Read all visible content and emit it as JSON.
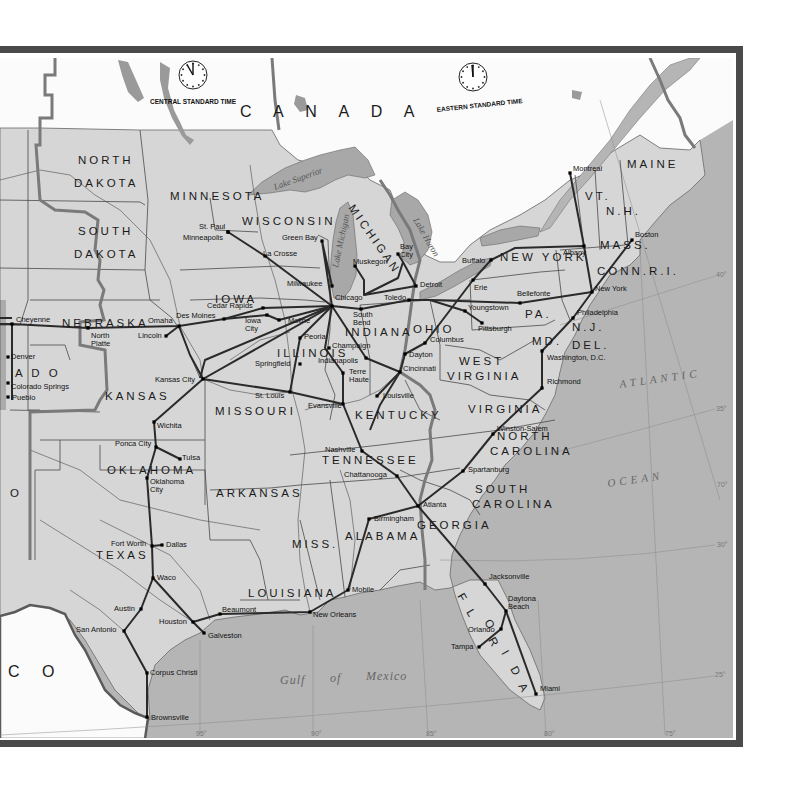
{
  "map": {
    "country_labels": [
      {
        "id": "canada",
        "text": "C A N A D A",
        "x": 240,
        "y": 117,
        "rot": 0
      },
      {
        "id": "mexico",
        "text": "C O",
        "x": 8,
        "y": 677,
        "rot": 0
      }
    ],
    "water_labels": [
      {
        "id": "atlantic",
        "text": "ATLANTIC",
        "x": 620,
        "y": 388,
        "rot": -8
      },
      {
        "id": "ocean",
        "text": "OCEAN",
        "x": 608,
        "y": 487,
        "rot": -8
      },
      {
        "id": "gulf",
        "text": "Gulf",
        "x": 280,
        "y": 684,
        "rot": 0
      },
      {
        "id": "of",
        "text": "of",
        "x": 330,
        "y": 682,
        "rot": 0
      },
      {
        "id": "mexico-gulf",
        "text": "Mexico",
        "x": 366,
        "y": 680,
        "rot": 0
      }
    ],
    "lake_labels": [
      {
        "id": "superior",
        "text": "Lake Superior",
        "x": 275,
        "y": 190,
        "rot": -20
      },
      {
        "id": "michigan",
        "text": "Lake Michigan",
        "x": 338,
        "y": 268,
        "rot": -78
      },
      {
        "id": "huron",
        "text": "Lake Huron",
        "x": 413,
        "y": 220,
        "rot": 60
      }
    ],
    "time_zones": [
      {
        "id": "central",
        "text": "CENTRAL STANDARD TIME",
        "x": 150,
        "y": 104,
        "clock_x": 193,
        "clock_y": 75,
        "hand_angle": -30
      },
      {
        "id": "eastern",
        "text": "EASTERN STANDARD TIME",
        "x": 437,
        "y": 112,
        "clock_x": 473,
        "clock_y": 77,
        "hand_angle": -5
      }
    ],
    "states": [
      {
        "text": "NORTH",
        "x": 78,
        "y": 164
      },
      {
        "text": "DAKOTA",
        "x": 74,
        "y": 187
      },
      {
        "text": "SOUTH",
        "x": 78,
        "y": 235
      },
      {
        "text": "DAKOTA",
        "x": 74,
        "y": 258
      },
      {
        "text": "MINNESOTA",
        "x": 170,
        "y": 200
      },
      {
        "text": "WISCONSIN",
        "x": 242,
        "y": 225
      },
      {
        "text": "IOWA",
        "x": 215,
        "y": 303
      },
      {
        "text": "NEBRASKA",
        "x": 62,
        "y": 327
      },
      {
        "text": "A D O",
        "x": 15,
        "y": 377
      },
      {
        "text": "KANSAS",
        "x": 105,
        "y": 400
      },
      {
        "text": "MISSOURI",
        "x": 215,
        "y": 415
      },
      {
        "text": "ILLINOIS",
        "x": 277,
        "y": 357
      },
      {
        "text": "INDIANA",
        "x": 345,
        "y": 336
      },
      {
        "text": "OHIO",
        "x": 413,
        "y": 333
      },
      {
        "text": "KENTUCKY",
        "x": 355,
        "y": 419
      },
      {
        "text": "TENNESSEE",
        "x": 322,
        "y": 464
      },
      {
        "text": "OKLAHOMA",
        "x": 107,
        "y": 474
      },
      {
        "text": "ARKANSAS",
        "x": 216,
        "y": 497
      },
      {
        "text": "TEXAS",
        "x": 96,
        "y": 559
      },
      {
        "text": "MISS.",
        "x": 292,
        "y": 548
      },
      {
        "text": "ALABAMA",
        "x": 345,
        "y": 540
      },
      {
        "text": "LOUISIANA",
        "x": 248,
        "y": 597
      },
      {
        "text": "GEORGIA",
        "x": 417,
        "y": 529
      },
      {
        "text": "SOUTH",
        "x": 475,
        "y": 493
      },
      {
        "text": "CAROLINA",
        "x": 472,
        "y": 508
      },
      {
        "text": "NORTH",
        "x": 497,
        "y": 440
      },
      {
        "text": "CAROLINA",
        "x": 490,
        "y": 455
      },
      {
        "text": "VIRGINIA",
        "x": 468,
        "y": 413
      },
      {
        "text": "WEST",
        "x": 459,
        "y": 365
      },
      {
        "text": "VIRGINIA",
        "x": 447,
        "y": 380
      },
      {
        "text": "PA.",
        "x": 525,
        "y": 318
      },
      {
        "text": "NEW YORK",
        "x": 500,
        "y": 261
      },
      {
        "text": "MD.",
        "x": 532,
        "y": 345
      },
      {
        "text": "DEL.",
        "x": 572,
        "y": 349
      },
      {
        "text": "N.J.",
        "x": 572,
        "y": 331
      },
      {
        "text": "CONN.R.I.",
        "x": 597,
        "y": 275
      },
      {
        "text": "MASS.",
        "x": 600,
        "y": 249
      },
      {
        "text": "N.H.",
        "x": 606,
        "y": 215
      },
      {
        "text": "VT.",
        "x": 585,
        "y": 200
      },
      {
        "text": "MAINE",
        "x": 627,
        "y": 168
      },
      {
        "text": "O",
        "x": 10,
        "y": 497
      }
    ],
    "michigan_label": {
      "text": "MICHIGAN",
      "x": 348,
      "y": 208
    },
    "florida_letters": [
      {
        "t": "F",
        "x": 457,
        "y": 596
      },
      {
        "t": "L",
        "x": 466,
        "y": 612
      },
      {
        "t": "O",
        "x": 484,
        "y": 622
      },
      {
        "t": "R",
        "x": 488,
        "y": 640
      },
      {
        "t": "I",
        "x": 501,
        "y": 653
      },
      {
        "t": "D",
        "x": 510,
        "y": 669
      },
      {
        "t": "A",
        "x": 518,
        "y": 686
      }
    ],
    "cities": [
      {
        "name": "Montreal",
        "x": 570,
        "y": 173,
        "lx": 573,
        "ly": 171
      },
      {
        "name": "Boston",
        "x": 632,
        "y": 240,
        "lx": 635,
        "ly": 237
      },
      {
        "name": "Albany",
        "x": 584,
        "y": 246,
        "lx": 563,
        "ly": 255
      },
      {
        "name": "New York",
        "x": 592,
        "y": 292,
        "lx": 595,
        "ly": 291
      },
      {
        "name": "Philadelphia",
        "x": 573,
        "y": 318,
        "lx": 577,
        "ly": 315
      },
      {
        "name": "Washington, D.C.",
        "x": 542,
        "y": 351,
        "lx": 547,
        "ly": 360
      },
      {
        "name": "Richmond",
        "x": 542,
        "y": 388,
        "lx": 547,
        "ly": 384
      },
      {
        "name": "Buffalo",
        "x": 491,
        "y": 260,
        "lx": 462,
        "ly": 263
      },
      {
        "name": "Erie",
        "x": 473,
        "y": 280,
        "lx": 474,
        "ly": 290
      },
      {
        "name": "Bellefonte",
        "x": 520,
        "y": 303,
        "lx": 517,
        "ly": 296
      },
      {
        "name": "Youngstown",
        "x": 465,
        "y": 311,
        "lx": 468,
        "ly": 310
      },
      {
        "name": "Pittsburgh",
        "x": 482,
        "y": 323,
        "lx": 478,
        "ly": 331
      },
      {
        "name": "Detroit",
        "x": 416,
        "y": 286,
        "lx": 420,
        "ly": 287
      },
      {
        "name": "Toledo",
        "x": 409,
        "y": 300,
        "lx": 384,
        "ly": 300
      },
      {
        "name": "Bay City",
        "x": 398,
        "y": 254,
        "lx": 400,
        "ly": 249
      },
      {
        "name": "Muskegon",
        "x": 355,
        "y": 266,
        "lx": 353,
        "ly": 264
      },
      {
        "name": "Green Bay",
        "x": 322,
        "y": 241,
        "lx": 282,
        "ly": 240
      },
      {
        "name": "Milwaukee",
        "x": 332,
        "y": 286,
        "lx": 287,
        "ly": 286
      },
      {
        "name": "Chicago",
        "x": 332,
        "y": 306,
        "lx": 335,
        "ly": 300
      },
      {
        "name": "South Bend",
        "x": 361,
        "y": 309,
        "lx": 353,
        "ly": 317
      },
      {
        "name": "La Crosse",
        "x": 265,
        "y": 256,
        "lx": 263,
        "ly": 256
      },
      {
        "name": "St. Paul",
        "x": 228,
        "y": 232,
        "lx": 199,
        "ly": 229
      },
      {
        "name": "Minneapolis",
        "x": 228,
        "y": 232,
        "lx": 183,
        "ly": 240
      },
      {
        "name": "Cedar Rapids",
        "x": 263,
        "y": 308,
        "lx": 207,
        "ly": 308
      },
      {
        "name": "Des Moines",
        "x": 224,
        "y": 319,
        "lx": 176,
        "ly": 318
      },
      {
        "name": "Iowa City",
        "x": 267,
        "y": 315,
        "lx": 245,
        "ly": 323
      },
      {
        "name": "Moline",
        "x": 279,
        "y": 320,
        "lx": 288,
        "ly": 323
      },
      {
        "name": "Peoria",
        "x": 300,
        "y": 338,
        "lx": 304,
        "ly": 339
      },
      {
        "name": "Champaign",
        "x": 329,
        "y": 348,
        "lx": 332,
        "ly": 348
      },
      {
        "name": "Indianapolis",
        "x": 366,
        "y": 358,
        "lx": 318,
        "ly": 363
      },
      {
        "name": "Springfield",
        "x": 300,
        "y": 364,
        "lx": 255,
        "ly": 366
      },
      {
        "name": "Terre Haute",
        "x": 343,
        "y": 373,
        "lx": 349,
        "ly": 374
      },
      {
        "name": "St. Louis",
        "x": 290,
        "y": 392,
        "lx": 255,
        "ly": 398
      },
      {
        "name": "Evansville",
        "x": 343,
        "y": 404,
        "lx": 308,
        "ly": 408
      },
      {
        "name": "Louisville",
        "x": 377,
        "y": 396,
        "lx": 383,
        "ly": 398
      },
      {
        "name": "Cincinnati",
        "x": 400,
        "y": 372,
        "lx": 403,
        "ly": 371
      },
      {
        "name": "Dayton",
        "x": 405,
        "y": 354,
        "lx": 409,
        "ly": 357
      },
      {
        "name": "Columbus",
        "x": 425,
        "y": 343,
        "lx": 430,
        "ly": 342
      },
      {
        "name": "Omaha",
        "x": 179,
        "y": 326,
        "lx": 148,
        "ly": 323
      },
      {
        "name": "Lincoln",
        "x": 166,
        "y": 336,
        "lx": 138,
        "ly": 338
      },
      {
        "name": "North Platte",
        "x": 88,
        "y": 328,
        "lx": 91,
        "ly": 338
      },
      {
        "name": "Cheyenne",
        "x": 12,
        "y": 324,
        "lx": 16,
        "ly": 322
      },
      {
        "name": "Denver",
        "x": 8,
        "y": 357,
        "lx": 11,
        "ly": 359
      },
      {
        "name": "Colorado Springs",
        "x": 8,
        "y": 383,
        "lx": 11,
        "ly": 389
      },
      {
        "name": "Pueblo",
        "x": 8,
        "y": 397,
        "lx": 12,
        "ly": 400
      },
      {
        "name": "Kansas City",
        "x": 203,
        "y": 379,
        "lx": 155,
        "ly": 382
      },
      {
        "name": "Wichita",
        "x": 154,
        "y": 422,
        "lx": 157,
        "ly": 428
      },
      {
        "name": "Ponca City",
        "x": 156,
        "y": 447,
        "lx": 115,
        "ly": 446
      },
      {
        "name": "Tulsa",
        "x": 180,
        "y": 459,
        "lx": 182,
        "ly": 460
      },
      {
        "name": "Oklahoma City",
        "x": 147,
        "y": 478,
        "lx": 150,
        "ly": 484
      },
      {
        "name": "Fort Worth",
        "x": 152,
        "y": 546,
        "lx": 111,
        "ly": 546
      },
      {
        "name": "Dallas",
        "x": 162,
        "y": 545,
        "lx": 166,
        "ly": 547
      },
      {
        "name": "Waco",
        "x": 153,
        "y": 578,
        "lx": 157,
        "ly": 580
      },
      {
        "name": "Austin",
        "x": 141,
        "y": 609,
        "lx": 114,
        "ly": 611
      },
      {
        "name": "San Antonio",
        "x": 124,
        "y": 631,
        "lx": 76,
        "ly": 632
      },
      {
        "name": "Houston",
        "x": 193,
        "y": 622,
        "lx": 159,
        "ly": 624
      },
      {
        "name": "Galveston",
        "x": 204,
        "y": 633,
        "lx": 208,
        "ly": 638
      },
      {
        "name": "Beaumont",
        "x": 220,
        "y": 614,
        "lx": 222,
        "ly": 612
      },
      {
        "name": "Corpus Christi",
        "x": 147,
        "y": 673,
        "lx": 150,
        "ly": 675
      },
      {
        "name": "Brownsville",
        "x": 147,
        "y": 717,
        "lx": 151,
        "ly": 720
      },
      {
        "name": "New Orleans",
        "x": 310,
        "y": 612,
        "lx": 313,
        "ly": 617
      },
      {
        "name": "Mobile",
        "x": 348,
        "y": 590,
        "lx": 352,
        "ly": 592
      },
      {
        "name": "Birmingham",
        "x": 369,
        "y": 519,
        "lx": 374,
        "ly": 521
      },
      {
        "name": "Atlanta",
        "x": 418,
        "y": 506,
        "lx": 423,
        "ly": 507
      },
      {
        "name": "Chattanooga",
        "x": 397,
        "y": 476,
        "lx": 344,
        "ly": 477
      },
      {
        "name": "Nashville",
        "x": 362,
        "y": 451,
        "lx": 325,
        "ly": 452
      },
      {
        "name": "Spartanburg",
        "x": 463,
        "y": 471,
        "lx": 468,
        "ly": 472
      },
      {
        "name": "Winston-Salem",
        "x": 493,
        "y": 434,
        "lx": 497,
        "ly": 431
      },
      {
        "name": "Jacksonville",
        "x": 485,
        "y": 584,
        "lx": 489,
        "ly": 579
      },
      {
        "name": "Daytona Beach",
        "x": 506,
        "y": 611,
        "lx": 508,
        "ly": 601
      },
      {
        "name": "Orlando",
        "x": 501,
        "y": 629,
        "lx": 468,
        "ly": 632
      },
      {
        "name": "Tampa",
        "x": 479,
        "y": 647,
        "lx": 451,
        "ly": 649
      },
      {
        "name": "Miami",
        "x": 536,
        "y": 694,
        "lx": 540,
        "ly": 691
      }
    ],
    "grid_labels": [
      {
        "text": "40°",
        "x": 716,
        "y": 277
      },
      {
        "text": "35°",
        "x": 716,
        "y": 411
      },
      {
        "text": "70°",
        "x": 717,
        "y": 487
      },
      {
        "text": "30°",
        "x": 717,
        "y": 547
      },
      {
        "text": "25°",
        "x": 715,
        "y": 677
      },
      {
        "text": "95°",
        "x": 196,
        "y": 736
      },
      {
        "text": "90°",
        "x": 311,
        "y": 736
      },
      {
        "text": "85°",
        "x": 426,
        "y": 736
      },
      {
        "text": "80°",
        "x": 544,
        "y": 736
      },
      {
        "text": "75°",
        "x": 665,
        "y": 736
      }
    ]
  },
  "colors": {
    "land_us": "#d4d4d4",
    "land_foreign": "#ffffff",
    "water": "#b3b3b3",
    "frame": "#555555",
    "route": "#2a2a2a",
    "state_border": "#444444",
    "tz_border": "#666666",
    "river": "#555555",
    "grid": "#888888"
  }
}
